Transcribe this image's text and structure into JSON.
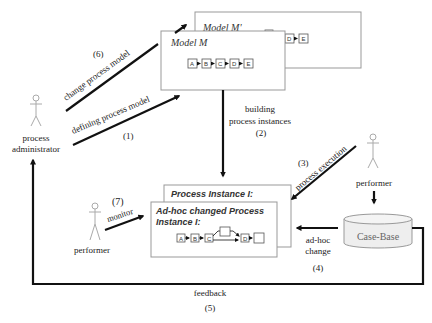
{
  "diagram": {
    "actors": {
      "administrator": {
        "label_line1": "process",
        "label_line2": "administrator"
      },
      "performer_left": {
        "label": "performer"
      },
      "performer_right": {
        "label": "performer"
      }
    },
    "models": {
      "model_m_prime": {
        "title": "Model M'",
        "nodes": [
          "D",
          "E"
        ]
      },
      "model_m": {
        "title": "Model M",
        "nodes": [
          "A",
          "B",
          "C",
          "D",
          "E"
        ]
      }
    },
    "instances": {
      "process_instance": {
        "title": "Process Instance I:"
      },
      "adhoc_instance": {
        "title_line1": "Ad-hoc changed Process",
        "title_line2": "Instance I:",
        "nodes": [
          "A",
          "B",
          "C",
          "",
          "D",
          ""
        ]
      }
    },
    "case_base": {
      "label": "Case-Base"
    },
    "edges": {
      "change_model": {
        "label": "change process model",
        "number": "(6)"
      },
      "define_model": {
        "label": "defining process model",
        "number": "(1)"
      },
      "build_instances": {
        "label_line1": "building",
        "label_line2": "process instances",
        "number": "(2)"
      },
      "process_execution": {
        "label": "process execution",
        "number": "(3)"
      },
      "adhoc_change": {
        "label_line1": "ad-hoc",
        "label_line2": "change",
        "number": "(4)"
      },
      "feedback": {
        "label": "feedback",
        "number": "(5)"
      },
      "monitor": {
        "label": "monitor",
        "number": "(7)"
      }
    }
  }
}
